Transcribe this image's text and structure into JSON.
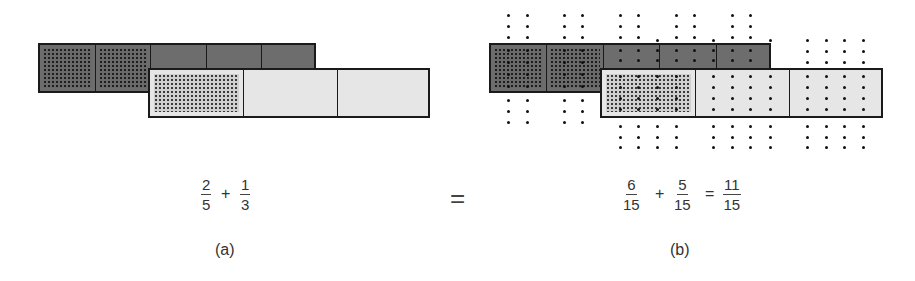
{
  "panel_a": {
    "caption": "(a)",
    "top_bar": {
      "parts": 5,
      "shaded": 2,
      "fraction_label": "2/5"
    },
    "bottom_bar": {
      "parts": 3,
      "shaded": 1,
      "fraction_label": "1/3"
    },
    "formula": {
      "term1": {
        "num": "2",
        "den": "5"
      },
      "op": "+",
      "term2": {
        "num": "1",
        "den": "3"
      }
    }
  },
  "middle": {
    "equals": "="
  },
  "panel_b": {
    "caption": "(b)",
    "top_bar": {
      "parts": 5,
      "subparts": 15,
      "shaded": 2
    },
    "bottom_bar": {
      "parts": 3,
      "subparts": 15,
      "shaded": 1
    },
    "formula": {
      "term1": {
        "num": "6",
        "den": "15"
      },
      "op1": "+",
      "term2": {
        "num": "5",
        "den": "15"
      },
      "op2": "=",
      "result": {
        "num": "11",
        "den": "15"
      }
    }
  },
  "colors": {
    "dark_bar": "#6d6d6d",
    "light_bar": "#e6e6e6",
    "border": "#1a1a1a",
    "dots": "#111111"
  }
}
